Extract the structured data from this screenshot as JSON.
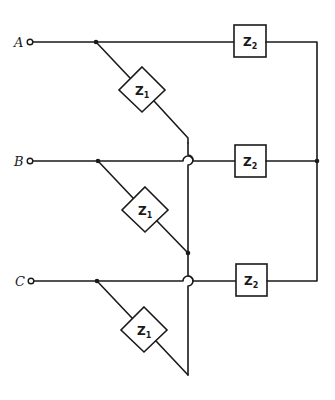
{
  "diagram": {
    "type": "three-phase circuit with wye-connected Z1 loads and wye-connected Z2 loads",
    "terminals": [
      {
        "label": "A"
      },
      {
        "label": "B"
      },
      {
        "label": "C"
      }
    ],
    "z1_impedances": [
      {
        "label": "Z",
        "sub": "1",
        "phase": "A"
      },
      {
        "label": "Z",
        "sub": "1",
        "phase": "B"
      },
      {
        "label": "Z",
        "sub": "1",
        "phase": "C"
      }
    ],
    "z2_impedances": [
      {
        "label": "Z",
        "sub": "2",
        "phase": "A"
      },
      {
        "label": "Z",
        "sub": "2",
        "phase": "B"
      },
      {
        "label": "Z",
        "sub": "2",
        "phase": "C"
      }
    ],
    "colors": {
      "line": "#1a1a1a",
      "background": "#ffffff"
    }
  }
}
